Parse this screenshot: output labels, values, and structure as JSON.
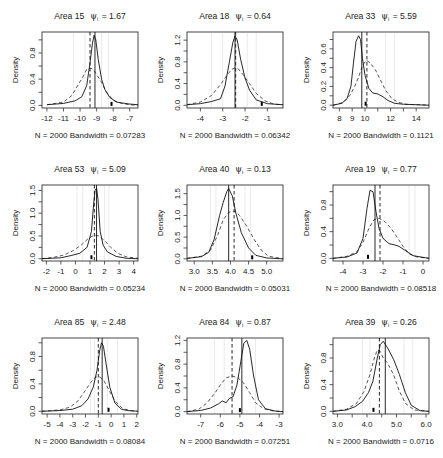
{
  "figure": {
    "layout": {
      "rows": 3,
      "cols": 3
    },
    "ylabel": "Density"
  },
  "chart_data": [
    {
      "type": "line",
      "title": "Area 15",
      "psi_label": "ψ",
      "psi_sub": "i",
      "psi": "1.67",
      "xlabel": "N = 2000   Bandwidth = 0.07283",
      "ylabel": "Density",
      "xlim": [
        -12.3,
        -6.5
      ],
      "ylim": [
        -0.04,
        1.12
      ],
      "xticks": [
        -12,
        -11,
        -10,
        -9,
        -8,
        -7
      ],
      "xtick_labels": [
        "-12",
        "-11",
        "-10",
        "-9",
        "-8",
        "-7"
      ],
      "yticks": [
        0.0,
        0.4,
        0.8
      ],
      "ytick_labels": [
        "0.0",
        "0.4",
        "0.8"
      ],
      "yminor": [
        0.2,
        0.6,
        1.0
      ],
      "solid_vline": -9.1,
      "dashed_vline": -9.4,
      "marker_x": -8.1,
      "grey_lines": [
        -10.4,
        -9.7,
        -8.7,
        -8.3
      ],
      "solid": {
        "x": [
          -12,
          -11,
          -10.3,
          -9.9,
          -9.6,
          -9.4,
          -9.25,
          -9.15,
          -9.05,
          -8.9,
          -8.7,
          -8.5,
          -8.2,
          -7.8,
          -7,
          -6.5
        ],
        "y": [
          0.01,
          0.03,
          0.07,
          0.13,
          0.3,
          0.65,
          0.95,
          1.07,
          1.0,
          0.7,
          0.4,
          0.24,
          0.12,
          0.05,
          0.02,
          0.01
        ]
      },
      "dashed": {
        "x": [
          -12,
          -11,
          -10.5,
          -10.1,
          -9.8,
          -9.6,
          -9.4,
          -9.2,
          -9.0,
          -8.7,
          -8.4,
          -8.0,
          -7.5,
          -7,
          -6.5
        ],
        "y": [
          0.01,
          0.05,
          0.15,
          0.32,
          0.45,
          0.55,
          0.57,
          0.55,
          0.47,
          0.35,
          0.2,
          0.08,
          0.03,
          0.01,
          0.0
        ]
      }
    },
    {
      "type": "line",
      "title": "Area 18",
      "psi_label": "ψ",
      "psi_sub": "i",
      "psi": "0.64",
      "xlabel": "N = 2000   Bandwidth = 0.06342",
      "ylabel": "Density",
      "xlim": [
        -4.6,
        -0.3
      ],
      "ylim": [
        -0.05,
        1.35
      ],
      "xticks": [
        -4,
        -3,
        -2,
        -1
      ],
      "xtick_labels": [
        "-4",
        "-3",
        "-2",
        "-1"
      ],
      "yticks": [
        0.0,
        0.4,
        0.8,
        1.2
      ],
      "ytick_labels": [
        "0.0",
        "0.4",
        "0.8",
        "1.2"
      ],
      "yminor": [
        0.2,
        0.6,
        1.0
      ],
      "solid_vline": -2.45,
      "dashed_vline": -2.42,
      "marker_x": -1.25,
      "grey_lines": [
        -3.5,
        -3.0,
        -1.9,
        -1.5
      ],
      "solid": {
        "x": [
          -4.6,
          -4,
          -3.5,
          -3.1,
          -2.9,
          -2.7,
          -2.55,
          -2.45,
          -2.35,
          -2.2,
          -2.0,
          -1.8,
          -1.5,
          -1.0,
          -0.3
        ],
        "y": [
          0.01,
          0.03,
          0.07,
          0.12,
          0.35,
          0.8,
          1.15,
          1.28,
          1.2,
          0.85,
          0.5,
          0.28,
          0.1,
          0.03,
          0.01
        ]
      },
      "dashed": {
        "x": [
          -4.6,
          -4,
          -3.5,
          -3.1,
          -2.8,
          -2.6,
          -2.45,
          -2.3,
          -2.1,
          -1.8,
          -1.5,
          -1.1,
          -0.7,
          -0.3
        ],
        "y": [
          0.01,
          0.06,
          0.18,
          0.38,
          0.56,
          0.66,
          0.69,
          0.67,
          0.57,
          0.4,
          0.22,
          0.08,
          0.02,
          0.01
        ]
      }
    },
    {
      "type": "line",
      "title": "Area 33",
      "psi_label": "ψ",
      "psi_sub": "i",
      "psi": "5.59",
      "xlabel": "N = 2000   Bandwidth = 0.1121",
      "ylabel": "Density",
      "xlim": [
        7.5,
        15.0
      ],
      "ylim": [
        -0.03,
        0.78
      ],
      "xticks": [
        8,
        9,
        10,
        12,
        14
      ],
      "xtick_labels": [
        "8",
        "9",
        "10",
        "12",
        "14"
      ],
      "xminor": [
        11,
        13
      ],
      "yticks": [
        0.0,
        0.2,
        0.4,
        0.6
      ],
      "ytick_labels": [
        "0.0",
        "0.2",
        "0.4",
        "0.6"
      ],
      "yminor": [
        0.1,
        0.3,
        0.5,
        0.7
      ],
      "solid_vline": 9.75,
      "dashed_vline": 10.15,
      "marker_x": 10.05,
      "grey_lines": [
        11.6,
        12.3
      ],
      "solid": {
        "x": [
          7.5,
          8.2,
          8.6,
          8.9,
          9.1,
          9.3,
          9.5,
          9.65,
          9.8,
          10.0,
          10.3,
          10.6,
          11.0,
          11.4,
          11.8,
          12.3,
          13,
          15
        ],
        "y": [
          0.0,
          0.02,
          0.07,
          0.2,
          0.45,
          0.68,
          0.74,
          0.7,
          0.5,
          0.32,
          0.18,
          0.13,
          0.12,
          0.09,
          0.05,
          0.02,
          0.01,
          0.0
        ]
      },
      "dashed": {
        "x": [
          7.5,
          8.3,
          8.8,
          9.2,
          9.5,
          9.8,
          10.1,
          10.4,
          10.8,
          11.2,
          11.6,
          12.1,
          12.6,
          13.2,
          15
        ],
        "y": [
          0.0,
          0.03,
          0.1,
          0.2,
          0.3,
          0.42,
          0.48,
          0.45,
          0.38,
          0.27,
          0.16,
          0.07,
          0.03,
          0.01,
          0.0
        ]
      }
    },
    {
      "type": "line",
      "title": "Area 53",
      "psi_label": "ψ",
      "psi_sub": "i",
      "psi": "5.09",
      "xlabel": "N = 2000   Bandwidth = 0.05234",
      "ylabel": "Density",
      "xlim": [
        -2.3,
        4.3
      ],
      "ylim": [
        -0.05,
        1.62
      ],
      "xticks": [
        -2,
        -1,
        0,
        1,
        2,
        3,
        4
      ],
      "xtick_labels": [
        "-2",
        "-1",
        "0",
        "1",
        "2",
        "3",
        "4"
      ],
      "yticks": [
        0.0,
        0.5,
        1.0,
        1.5
      ],
      "ytick_labels": [
        "0.0",
        "0.5",
        "1.0",
        "1.5"
      ],
      "yminor": [
        0.25,
        0.75,
        1.25
      ],
      "solid_vline": 1.45,
      "dashed_vline": 1.3,
      "marker_x": 1.1,
      "grey_lines": [
        0.1,
        0.5,
        2.0,
        2.3
      ],
      "solid": {
        "x": [
          -2.3,
          -1,
          -0.3,
          0.3,
          0.8,
          1.1,
          1.25,
          1.35,
          1.45,
          1.55,
          1.7,
          1.9,
          2.2,
          2.8,
          3.5,
          4.3
        ],
        "y": [
          0.0,
          0.02,
          0.07,
          0.12,
          0.25,
          0.6,
          1.2,
          1.5,
          1.55,
          1.3,
          0.6,
          0.3,
          0.15,
          0.05,
          0.01,
          0.0
        ]
      },
      "dashed": {
        "x": [
          -2.3,
          -1.5,
          -0.8,
          -0.2,
          0.4,
          0.9,
          1.3,
          1.6,
          2.0,
          2.4,
          2.9,
          3.5,
          4.3
        ],
        "y": [
          0.0,
          0.03,
          0.08,
          0.17,
          0.3,
          0.45,
          0.52,
          0.5,
          0.4,
          0.26,
          0.12,
          0.04,
          0.01
        ]
      }
    },
    {
      "type": "line",
      "title": "Area 40",
      "psi_label": "ψ",
      "psi_sub": "i",
      "psi": "0.13",
      "xlabel": "N = 2000   Bandwidth = 0.05031",
      "ylabel": "Density",
      "xlim": [
        2.8,
        5.45
      ],
      "ylim": [
        -0.05,
        1.7
      ],
      "xticks": [
        3.0,
        3.5,
        4.0,
        4.5,
        5.0
      ],
      "xtick_labels": [
        "3.0",
        "3.5",
        "4.0",
        "4.5",
        "5.0"
      ],
      "yticks": [
        0.0,
        0.5,
        1.0,
        1.5
      ],
      "ytick_labels": [
        "0.0",
        "0.5",
        "1.0",
        "1.5"
      ],
      "yminor": [
        0.25,
        0.75,
        1.25
      ],
      "solid_vline": 3.95,
      "dashed_vline": 4.1,
      "marker_x": 4.6,
      "grey_lines": [
        3.45,
        3.6,
        4.4,
        4.55
      ],
      "solid": {
        "x": [
          2.8,
          3.2,
          3.4,
          3.55,
          3.7,
          3.8,
          3.9,
          3.95,
          4.05,
          4.15,
          4.3,
          4.5,
          4.7,
          5.0,
          5.45
        ],
        "y": [
          0.01,
          0.05,
          0.15,
          0.45,
          1.0,
          1.3,
          1.55,
          1.62,
          1.45,
          1.05,
          0.6,
          0.25,
          0.08,
          0.02,
          0.0
        ]
      },
      "dashed": {
        "x": [
          2.8,
          3.2,
          3.45,
          3.65,
          3.8,
          3.95,
          4.1,
          4.25,
          4.45,
          4.65,
          4.85,
          5.05,
          5.45
        ],
        "y": [
          0.01,
          0.06,
          0.2,
          0.55,
          0.9,
          1.07,
          1.1,
          1.0,
          0.75,
          0.45,
          0.2,
          0.06,
          0.0
        ]
      }
    },
    {
      "type": "line",
      "title": "Area 19",
      "psi_label": "ψ",
      "psi_sub": "i",
      "psi": "0.77",
      "xlabel": "N = 2000   Bandwidth = 0.08518",
      "ylabel": "Density",
      "xlim": [
        -4.5,
        0.3
      ],
      "ylim": [
        -0.04,
        1.1
      ],
      "xticks": [
        -4,
        -3,
        -2,
        -1,
        0
      ],
      "xtick_labels": [
        "-4",
        "-3",
        "-2",
        "-1",
        "0"
      ],
      "yticks": [
        0.0,
        0.4,
        0.8
      ],
      "ytick_labels": [
        "0.0",
        "0.4",
        "0.8"
      ],
      "yminor": [
        0.2,
        0.6,
        1.0
      ],
      "solid_vline": -2.4,
      "dashed_vline": -2.15,
      "marker_x": -2.75,
      "grey_lines": [
        -0.7,
        -0.4
      ],
      "solid": {
        "x": [
          -4.5,
          -3.8,
          -3.3,
          -3.0,
          -2.8,
          -2.65,
          -2.5,
          -2.35,
          -2.2,
          -2.0,
          -1.7,
          -1.4,
          -1.2,
          -0.9,
          -0.5,
          0.3
        ],
        "y": [
          0.0,
          0.02,
          0.08,
          0.3,
          0.75,
          1.02,
          1.0,
          0.7,
          0.45,
          0.3,
          0.22,
          0.2,
          0.18,
          0.12,
          0.04,
          0.0
        ]
      },
      "dashed": {
        "x": [
          -4.5,
          -3.8,
          -3.3,
          -3.0,
          -2.7,
          -2.45,
          -2.2,
          -1.9,
          -1.6,
          -1.3,
          -1.0,
          -0.7,
          -0.3,
          0.3
        ],
        "y": [
          0.0,
          0.03,
          0.1,
          0.24,
          0.45,
          0.58,
          0.6,
          0.55,
          0.45,
          0.32,
          0.18,
          0.07,
          0.02,
          0.0
        ]
      }
    },
    {
      "type": "line",
      "title": "Area 85",
      "psi_label": "ψ",
      "psi_sub": "i",
      "psi": "2.48",
      "xlabel": "N = 2000   Bandwidth = 0.08084",
      "ylabel": "Density",
      "xlim": [
        -5.4,
        2.1
      ],
      "ylim": [
        -0.04,
        1.07
      ],
      "xticks": [
        -5,
        -4,
        -3,
        -2,
        -1,
        0,
        1,
        2
      ],
      "xtick_labels": [
        "-5",
        "-4",
        "-3",
        "-2",
        "-1",
        "0",
        "1",
        "2"
      ],
      "yticks": [
        0.0,
        0.4,
        0.8
      ],
      "ytick_labels": [
        "0.0",
        "0.4",
        "0.8"
      ],
      "yminor": [
        0.2,
        0.6,
        1.0
      ],
      "solid_vline": -0.7,
      "dashed_vline": -1.0,
      "marker_x": -0.2,
      "grey_lines": [
        -1.6,
        -1.3,
        -0.3,
        0.5
      ],
      "solid": {
        "x": [
          -5.4,
          -4,
          -3,
          -2.3,
          -1.8,
          -1.4,
          -1.1,
          -0.9,
          -0.75,
          -0.6,
          -0.4,
          -0.1,
          0.3,
          0.8,
          1.3,
          2.1
        ],
        "y": [
          0.0,
          0.01,
          0.03,
          0.08,
          0.18,
          0.35,
          0.6,
          0.88,
          1.0,
          0.95,
          0.7,
          0.35,
          0.12,
          0.03,
          0.01,
          0.0
        ]
      },
      "dashed": {
        "x": [
          -5.4,
          -4,
          -3.2,
          -2.6,
          -2.1,
          -1.6,
          -1.2,
          -0.9,
          -0.6,
          -0.2,
          0.3,
          0.9,
          1.5,
          2.1
        ],
        "y": [
          0.0,
          0.02,
          0.06,
          0.15,
          0.28,
          0.42,
          0.5,
          0.5,
          0.46,
          0.32,
          0.15,
          0.04,
          0.01,
          0.0
        ]
      }
    },
    {
      "type": "line",
      "title": "Area 84",
      "psi_label": "ψ",
      "psi_sub": "i",
      "psi": "0.87",
      "xlabel": "N = 2000   Bandwidth = 0.07251",
      "ylabel": "Density",
      "xlim": [
        -7.7,
        -2.8
      ],
      "ylim": [
        -0.04,
        1.24
      ],
      "xticks": [
        -7,
        -6,
        -5,
        -4,
        -3
      ],
      "xtick_labels": [
        "-7",
        "-6",
        "-5",
        "-4",
        "-3"
      ],
      "yticks": [
        0.0,
        0.4,
        0.8,
        1.2
      ],
      "ytick_labels": [
        "0.0",
        "0.4",
        "0.8",
        "1.2"
      ],
      "yminor": [
        0.2,
        0.6,
        1.0
      ],
      "solid_vline": -4.9,
      "dashed_vline": -5.4,
      "marker_x": -5.0,
      "grey_lines": [
        -6.3,
        -5.8,
        -4.2
      ],
      "solid": {
        "x": [
          -7.7,
          -7,
          -6.5,
          -6.1,
          -5.9,
          -5.7,
          -5.55,
          -5.35,
          -5.15,
          -4.95,
          -4.8,
          -4.65,
          -4.5,
          -4.3,
          -4.05,
          -3.7,
          -3.2,
          -2.8
        ],
        "y": [
          0.0,
          0.02,
          0.06,
          0.13,
          0.18,
          0.15,
          0.22,
          0.25,
          0.45,
          0.85,
          1.15,
          1.2,
          1.05,
          0.6,
          0.2,
          0.05,
          0.01,
          0.0
        ]
      },
      "dashed": {
        "x": [
          -7.7,
          -7.1,
          -6.7,
          -6.3,
          -6.0,
          -5.7,
          -5.4,
          -5.1,
          -4.8,
          -4.5,
          -4.2,
          -3.8,
          -3.3,
          -2.8
        ],
        "y": [
          0.0,
          0.04,
          0.14,
          0.3,
          0.45,
          0.57,
          0.6,
          0.57,
          0.48,
          0.32,
          0.15,
          0.05,
          0.01,
          0.0
        ]
      }
    },
    {
      "type": "line",
      "title": "Area 39",
      "psi_label": "ψ",
      "psi_sub": "i",
      "psi": "0.26",
      "xlabel": "N = 2000   Bandwidth = 0.0716",
      "ylabel": "Density",
      "xlim": [
        2.85,
        6.1
      ],
      "ylim": [
        -0.04,
        1.1
      ],
      "xticks": [
        3.0,
        4.0,
        5.0,
        6.0
      ],
      "xtick_labels": [
        "3.0",
        "4.0",
        "5.0",
        "6.0"
      ],
      "xminor": [
        3.5,
        4.5,
        5.5
      ],
      "yticks": [
        0.0,
        0.4,
        0.8
      ],
      "ytick_labels": [
        "0.0",
        "0.4",
        "0.8"
      ],
      "yminor": [
        0.2,
        0.6,
        1.0
      ],
      "solid_vline": 4.62,
      "dashed_vline": 4.42,
      "marker_x": 4.22,
      "grey_lines": [
        3.85,
        4.1,
        5.25,
        5.55
      ],
      "solid": {
        "x": [
          2.85,
          3.3,
          3.6,
          3.85,
          4.05,
          4.2,
          4.35,
          4.45,
          4.55,
          4.7,
          4.9,
          5.1,
          5.3,
          5.5,
          5.8,
          6.1
        ],
        "y": [
          0.0,
          0.02,
          0.07,
          0.15,
          0.28,
          0.45,
          0.8,
          1.0,
          1.05,
          0.95,
          0.78,
          0.55,
          0.28,
          0.09,
          0.01,
          0.0
        ]
      },
      "dashed": {
        "x": [
          2.85,
          3.3,
          3.65,
          3.9,
          4.1,
          4.25,
          4.35,
          4.45,
          4.55,
          4.7,
          4.9,
          5.1,
          5.3,
          5.6,
          6.1
        ],
        "y": [
          0.0,
          0.03,
          0.12,
          0.3,
          0.55,
          0.8,
          0.92,
          0.9,
          0.8,
          0.72,
          0.55,
          0.3,
          0.12,
          0.02,
          0.0
        ]
      }
    }
  ]
}
